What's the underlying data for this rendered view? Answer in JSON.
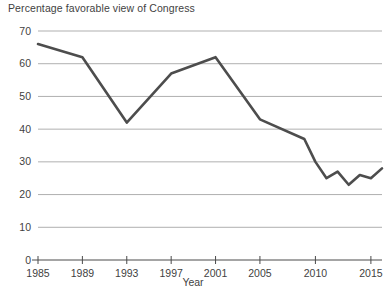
{
  "chart_data": {
    "type": "line",
    "title": "Percentage favorable view of Congress",
    "xlabel": "Year",
    "ylabel": "",
    "xlim": [
      1985,
      2016
    ],
    "ylim": [
      0,
      70
    ],
    "grid": true,
    "legend": "none",
    "line_color": "#4d4d4d",
    "grid_color": "#8c8c8c",
    "xticks": [
      "1985",
      "1989",
      "1993",
      "1997",
      "2001",
      "2005",
      "2010",
      "2015"
    ],
    "xtick_values": [
      1985,
      1989,
      1993,
      1997,
      2001,
      2005,
      2010,
      2015
    ],
    "yticks": [
      "0",
      "10",
      "20",
      "30",
      "40",
      "50",
      "60",
      "70"
    ],
    "ytick_values": [
      0,
      10,
      20,
      30,
      40,
      50,
      60,
      70
    ],
    "x": [
      1985,
      1989,
      1993,
      1997,
      2001,
      2005,
      2009,
      2010,
      2011,
      2012,
      2013,
      2014,
      2015,
      2016
    ],
    "values": [
      66,
      62,
      42,
      57,
      62,
      43,
      37,
      30,
      25,
      27,
      23,
      26,
      25,
      28
    ],
    "series": [
      {
        "name": "Percentage favorable view of Congress",
        "points": [
          {
            "x": 1985,
            "y": 66
          },
          {
            "x": 1989,
            "y": 62
          },
          {
            "x": 1993,
            "y": 42
          },
          {
            "x": 1997,
            "y": 57
          },
          {
            "x": 2001,
            "y": 62
          },
          {
            "x": 2005,
            "y": 43
          },
          {
            "x": 2009,
            "y": 37
          },
          {
            "x": 2010,
            "y": 30
          },
          {
            "x": 2011,
            "y": 25
          },
          {
            "x": 2012,
            "y": 27
          },
          {
            "x": 2013,
            "y": 23
          },
          {
            "x": 2014,
            "y": 26
          },
          {
            "x": 2015,
            "y": 25
          },
          {
            "x": 2016,
            "y": 28
          }
        ]
      }
    ]
  }
}
